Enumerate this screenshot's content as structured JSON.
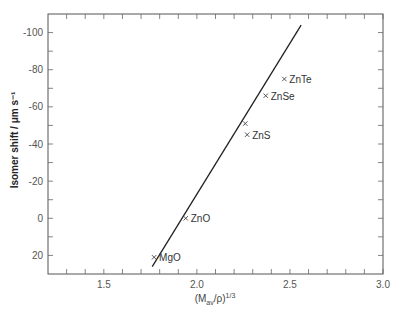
{
  "chart_data": {
    "type": "scatter",
    "title": "",
    "xlabel": "(M_av/ρ)^1/3",
    "xlabel_parts": {
      "pre": "(M",
      "sub": "av",
      "mid": "/ρ)",
      "sup": "1/3"
    },
    "ylabel": "Isomer shift / μm s⁻¹",
    "xlim": [
      1.2,
      3.0
    ],
    "ylim": [
      30,
      -110
    ],
    "y_inverted": true,
    "grid": false,
    "x_ticks": [
      1.5,
      2.0,
      2.5,
      3.0
    ],
    "x_tick_labels": [
      "1.5",
      "2.0",
      "2.5",
      "3.0"
    ],
    "x_minor_step": 0.1,
    "y_ticks": [
      -100,
      -80,
      -60,
      -40,
      -20,
      0,
      20
    ],
    "y_tick_labels": [
      "-100",
      "-80",
      "-60",
      "-40",
      "-20",
      "0",
      "20"
    ],
    "y_minor_step": 10,
    "marker": "x",
    "points": [
      {
        "label": "MgO",
        "x": 1.77,
        "y": 21
      },
      {
        "label": "ZnO",
        "x": 1.94,
        "y": 0
      },
      {
        "label": "",
        "x": 2.26,
        "y": -51
      },
      {
        "label": "ZnS",
        "x": 2.27,
        "y": -45
      },
      {
        "label": "ZnSe",
        "x": 2.37,
        "y": -66
      },
      {
        "label": "ZnTe",
        "x": 2.47,
        "y": -75
      }
    ],
    "fit_line": {
      "x": [
        1.76,
        2.56
      ],
      "y": [
        26,
        -104
      ]
    },
    "legend": null
  }
}
